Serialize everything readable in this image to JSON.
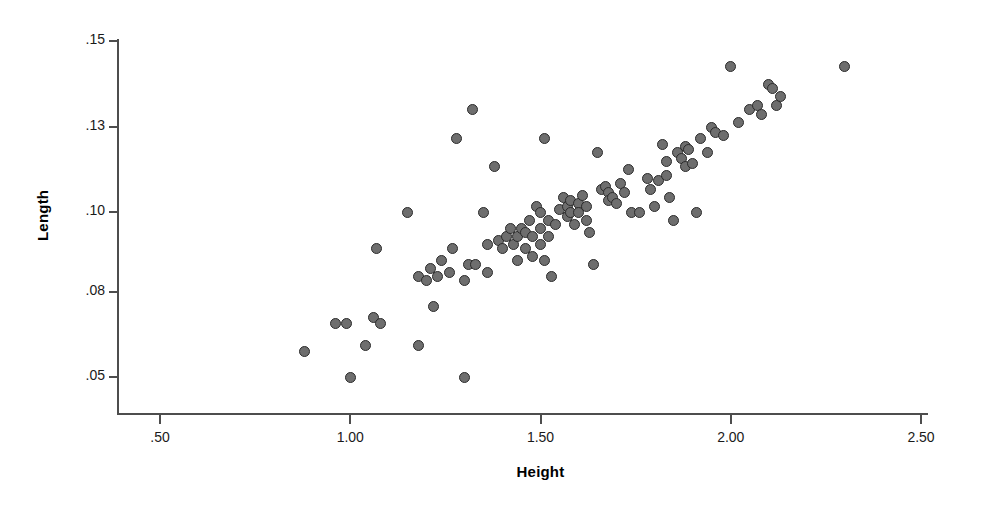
{
  "chart_data": {
    "type": "scatter",
    "title": "",
    "xlabel": "Height",
    "ylabel": "Length",
    "xlim": [
      0.3,
      2.6
    ],
    "ylim": [
      0.04,
      0.155
    ],
    "grid": false,
    "legend": null,
    "xticks": [
      0.5,
      1.0,
      1.5,
      2.0,
      2.5
    ],
    "xtick_labels": [
      ".50",
      "1.00",
      "1.50",
      "2.00",
      "2.50"
    ],
    "yticks": [
      0.05,
      0.08,
      0.1,
      0.13,
      0.15
    ],
    "ytick_labels": [
      ".05",
      ".08",
      ".10",
      ".13",
      ".15"
    ],
    "marker": {
      "shape": "circle",
      "fill_color": "#6e6e6e",
      "edge_color": "#2b2b2b",
      "size_px": 11,
      "edge_width_px": 1.5
    },
    "axis_color": "#4d4d4d",
    "n_points": 108,
    "points": [
      {
        "x": 0.88,
        "y": 0.059
      },
      {
        "x": 0.96,
        "y": 0.069
      },
      {
        "x": 0.99,
        "y": 0.069
      },
      {
        "x": 1.0,
        "y": 0.05
      },
      {
        "x": 1.04,
        "y": 0.061
      },
      {
        "x": 1.06,
        "y": 0.071
      },
      {
        "x": 1.08,
        "y": 0.069
      },
      {
        "x": 1.07,
        "y": 0.091
      },
      {
        "x": 1.15,
        "y": 0.1
      },
      {
        "x": 1.18,
        "y": 0.061
      },
      {
        "x": 1.18,
        "y": 0.084
      },
      {
        "x": 1.2,
        "y": 0.083
      },
      {
        "x": 1.21,
        "y": 0.086
      },
      {
        "x": 1.22,
        "y": 0.075
      },
      {
        "x": 1.23,
        "y": 0.084
      },
      {
        "x": 1.24,
        "y": 0.088
      },
      {
        "x": 1.26,
        "y": 0.085
      },
      {
        "x": 1.27,
        "y": 0.091
      },
      {
        "x": 1.28,
        "y": 0.126
      },
      {
        "x": 1.3,
        "y": 0.05
      },
      {
        "x": 1.3,
        "y": 0.083
      },
      {
        "x": 1.31,
        "y": 0.087
      },
      {
        "x": 1.32,
        "y": 0.134
      },
      {
        "x": 1.33,
        "y": 0.087
      },
      {
        "x": 1.35,
        "y": 0.1
      },
      {
        "x": 1.36,
        "y": 0.092
      },
      {
        "x": 1.36,
        "y": 0.085
      },
      {
        "x": 1.38,
        "y": 0.116
      },
      {
        "x": 1.39,
        "y": 0.093
      },
      {
        "x": 1.4,
        "y": 0.091
      },
      {
        "x": 1.41,
        "y": 0.094
      },
      {
        "x": 1.42,
        "y": 0.096
      },
      {
        "x": 1.43,
        "y": 0.092
      },
      {
        "x": 1.44,
        "y": 0.094
      },
      {
        "x": 1.44,
        "y": 0.088
      },
      {
        "x": 1.45,
        "y": 0.096
      },
      {
        "x": 1.46,
        "y": 0.095
      },
      {
        "x": 1.46,
        "y": 0.091
      },
      {
        "x": 1.47,
        "y": 0.098
      },
      {
        "x": 1.48,
        "y": 0.094
      },
      {
        "x": 1.48,
        "y": 0.089
      },
      {
        "x": 1.49,
        "y": 0.102
      },
      {
        "x": 1.5,
        "y": 0.1
      },
      {
        "x": 1.5,
        "y": 0.096
      },
      {
        "x": 1.5,
        "y": 0.092
      },
      {
        "x": 1.51,
        "y": 0.126
      },
      {
        "x": 1.51,
        "y": 0.088
      },
      {
        "x": 1.52,
        "y": 0.098
      },
      {
        "x": 1.52,
        "y": 0.094
      },
      {
        "x": 1.53,
        "y": 0.084
      },
      {
        "x": 1.54,
        "y": 0.097
      },
      {
        "x": 1.55,
        "y": 0.101
      },
      {
        "x": 1.56,
        "y": 0.105
      },
      {
        "x": 1.57,
        "y": 0.102
      },
      {
        "x": 1.57,
        "y": 0.099
      },
      {
        "x": 1.58,
        "y": 0.104
      },
      {
        "x": 1.58,
        "y": 0.1
      },
      {
        "x": 1.59,
        "y": 0.097
      },
      {
        "x": 1.6,
        "y": 0.103
      },
      {
        "x": 1.6,
        "y": 0.1
      },
      {
        "x": 1.61,
        "y": 0.106
      },
      {
        "x": 1.62,
        "y": 0.098
      },
      {
        "x": 1.62,
        "y": 0.102
      },
      {
        "x": 1.63,
        "y": 0.095
      },
      {
        "x": 1.64,
        "y": 0.087
      },
      {
        "x": 1.65,
        "y": 0.121
      },
      {
        "x": 1.66,
        "y": 0.108
      },
      {
        "x": 1.67,
        "y": 0.109
      },
      {
        "x": 1.68,
        "y": 0.107
      },
      {
        "x": 1.68,
        "y": 0.104
      },
      {
        "x": 1.69,
        "y": 0.105
      },
      {
        "x": 1.7,
        "y": 0.103
      },
      {
        "x": 1.71,
        "y": 0.11
      },
      {
        "x": 1.72,
        "y": 0.107
      },
      {
        "x": 1.73,
        "y": 0.115
      },
      {
        "x": 1.74,
        "y": 0.1
      },
      {
        "x": 1.76,
        "y": 0.1
      },
      {
        "x": 1.78,
        "y": 0.112
      },
      {
        "x": 1.79,
        "y": 0.108
      },
      {
        "x": 1.8,
        "y": 0.102
      },
      {
        "x": 1.81,
        "y": 0.111
      },
      {
        "x": 1.82,
        "y": 0.124
      },
      {
        "x": 1.83,
        "y": 0.118
      },
      {
        "x": 1.83,
        "y": 0.113
      },
      {
        "x": 1.84,
        "y": 0.105
      },
      {
        "x": 1.85,
        "y": 0.098
      },
      {
        "x": 1.86,
        "y": 0.121
      },
      {
        "x": 1.87,
        "y": 0.119
      },
      {
        "x": 1.88,
        "y": 0.123
      },
      {
        "x": 1.88,
        "y": 0.116
      },
      {
        "x": 1.89,
        "y": 0.122
      },
      {
        "x": 1.9,
        "y": 0.117
      },
      {
        "x": 1.91,
        "y": 0.1
      },
      {
        "x": 1.92,
        "y": 0.126
      },
      {
        "x": 1.94,
        "y": 0.121
      },
      {
        "x": 1.95,
        "y": 0.13
      },
      {
        "x": 1.96,
        "y": 0.128
      },
      {
        "x": 1.98,
        "y": 0.127
      },
      {
        "x": 2.0,
        "y": 0.144
      },
      {
        "x": 2.02,
        "y": 0.131
      },
      {
        "x": 2.05,
        "y": 0.134
      },
      {
        "x": 2.07,
        "y": 0.135
      },
      {
        "x": 2.08,
        "y": 0.133
      },
      {
        "x": 2.1,
        "y": 0.14
      },
      {
        "x": 2.11,
        "y": 0.139
      },
      {
        "x": 2.12,
        "y": 0.135
      },
      {
        "x": 2.13,
        "y": 0.137
      },
      {
        "x": 2.3,
        "y": 0.144
      }
    ]
  },
  "axes": {
    "x_title": "Height",
    "y_title": "Length"
  }
}
